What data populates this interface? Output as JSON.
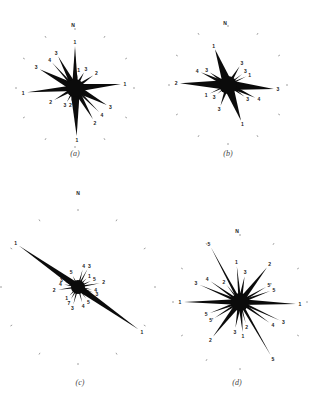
{
  "figure": {
    "panels": [
      {
        "id": "a",
        "caption": "(a)",
        "center": [
          75,
          88
        ],
        "north_label": "N",
        "north_pos": [
          73,
          27
        ],
        "ring_radius": 58,
        "spikes": [
          {
            "angle": 0,
            "length": 42,
            "width": 6,
            "label": "1"
          },
          {
            "angle": -28,
            "length": 36,
            "width": 6,
            "label": "3"
          },
          {
            "angle": -42,
            "length": 34,
            "width": 3,
            "label": "4"
          },
          {
            "angle": -62,
            "length": 40,
            "width": 8,
            "label": "3"
          },
          {
            "angle": -95,
            "length": 48,
            "width": 6,
            "label": "1"
          },
          {
            "angle": -120,
            "length": 24,
            "width": 4,
            "label": "2"
          },
          {
            "angle": -150,
            "length": 16,
            "width": 3,
            "label": "3"
          },
          {
            "angle": -165,
            "length": 14,
            "width": 3,
            "label": "2"
          },
          {
            "angle": 178,
            "length": 48,
            "width": 10,
            "label": "1"
          },
          {
            "angle": 150,
            "length": 36,
            "width": 6,
            "label": "2"
          },
          {
            "angle": 135,
            "length": 34,
            "width": 3,
            "label": "4"
          },
          {
            "angle": 118,
            "length": 36,
            "width": 8,
            "label": "3"
          },
          {
            "angle": 85,
            "length": 46,
            "width": 8,
            "label": "1"
          },
          {
            "angle": 55,
            "length": 22,
            "width": 4,
            "label": "2"
          },
          {
            "angle": 30,
            "length": 18,
            "width": 4,
            "label": "3"
          },
          {
            "angle": 12,
            "length": 14,
            "width": 2,
            "label": "1"
          }
        ]
      },
      {
        "id": "b",
        "caption": "(b)",
        "center": [
          228,
          85
        ],
        "north_label": "N",
        "north_pos": [
          225,
          25
        ],
        "ring_radius": 58,
        "spikes": [
          {
            "angle": -20,
            "length": 38,
            "width": 10,
            "label": "1"
          },
          {
            "angle": 32,
            "length": 22,
            "width": 4,
            "label": "3"
          },
          {
            "angle": 52,
            "length": 18,
            "width": 2,
            "label": "3"
          },
          {
            "angle": 65,
            "length": 20,
            "width": 2,
            "label": "1"
          },
          {
            "angle": 95,
            "length": 46,
            "width": 10,
            "label": "3"
          },
          {
            "angle": 115,
            "length": 30,
            "width": 5,
            "label": "4"
          },
          {
            "angle": 125,
            "length": 20,
            "width": 3,
            "label": "3"
          },
          {
            "angle": 160,
            "length": 38,
            "width": 10,
            "label": "1"
          },
          {
            "angle": 200,
            "length": 22,
            "width": 4,
            "label": "3"
          },
          {
            "angle": 230,
            "length": 14,
            "width": 2,
            "label": "3"
          },
          {
            "angle": 245,
            "length": 20,
            "width": 2,
            "label": "1"
          },
          {
            "angle": 272,
            "length": 48,
            "width": 10,
            "label": "2"
          },
          {
            "angle": 295,
            "length": 30,
            "width": 5,
            "label": "4"
          },
          {
            "angle": 305,
            "length": 22,
            "width": 4,
            "label": "3"
          }
        ]
      },
      {
        "id": "c",
        "caption": "(c)",
        "center": [
          78,
          287
        ],
        "north_label": "N",
        "north_pos": [
          78,
          195
        ],
        "ring_radius": 76,
        "spikes": [
          {
            "angle": -55,
            "length": 72,
            "width": 7,
            "label": "1"
          },
          {
            "angle": 125,
            "length": 74,
            "width": 7,
            "label": "1"
          },
          {
            "angle": 15,
            "length": 18,
            "width": 2,
            "label": "4"
          },
          {
            "angle": 28,
            "length": 20,
            "width": 2,
            "label": "3"
          },
          {
            "angle": 45,
            "length": 12,
            "width": 2,
            "label": "1"
          },
          {
            "angle": 65,
            "length": 14,
            "width": 2,
            "label": "5"
          },
          {
            "angle": 80,
            "length": 22,
            "width": 2,
            "label": "2"
          },
          {
            "angle": 100,
            "length": 14,
            "width": 2,
            "label": "4"
          },
          {
            "angle": 110,
            "length": 16,
            "width": 2,
            "label": "3"
          },
          {
            "angle": 145,
            "length": 14,
            "width": 2,
            "label": "5"
          },
          {
            "angle": 165,
            "length": 16,
            "width": 2,
            "label": "4"
          },
          {
            "angle": 195,
            "length": 18,
            "width": 2,
            "label": "3"
          },
          {
            "angle": 210,
            "length": 14,
            "width": 2,
            "label": "7"
          },
          {
            "angle": 225,
            "length": 12,
            "width": 2,
            "label": "1"
          },
          {
            "angle": 262,
            "length": 20,
            "width": 2,
            "label": "2"
          },
          {
            "angle": 280,
            "length": 14,
            "width": 2,
            "label": "4"
          },
          {
            "angle": 292,
            "length": 14,
            "width": 2,
            "label": "3"
          },
          {
            "angle": 335,
            "length": 12,
            "width": 2,
            "label": "5"
          }
        ]
      },
      {
        "id": "d",
        "caption": "(d)",
        "center": [
          240,
          302
        ],
        "north_label": "N",
        "north_pos": [
          237,
          233
        ],
        "ring_radius": 66,
        "spikes": [
          {
            "angle": -28,
            "length": 62,
            "width": 3,
            "label": "5"
          },
          {
            "angle": -5,
            "length": 36,
            "width": 3,
            "label": "1"
          },
          {
            "angle": 10,
            "length": 26,
            "width": 4,
            "label": "3"
          },
          {
            "angle": 38,
            "length": 44,
            "width": 6,
            "label": "2"
          },
          {
            "angle": 60,
            "length": 30,
            "width": 3,
            "label": "5'"
          },
          {
            "angle": 70,
            "length": 32,
            "width": 3,
            "label": "5"
          },
          {
            "angle": 92,
            "length": 56,
            "width": 6,
            "label": "1"
          },
          {
            "angle": 115,
            "length": 44,
            "width": 3,
            "label": "3"
          },
          {
            "angle": 125,
            "length": 36,
            "width": 3,
            "label": "4"
          },
          {
            "angle": 150,
            "length": 62,
            "width": 3,
            "label": "5"
          },
          {
            "angle": 165,
            "length": 22,
            "width": 2,
            "label": "2"
          },
          {
            "angle": 175,
            "length": 30,
            "width": 4,
            "label": "1"
          },
          {
            "angle": 190,
            "length": 26,
            "width": 4,
            "label": "3"
          },
          {
            "angle": 218,
            "length": 44,
            "width": 6,
            "label": "2"
          },
          {
            "angle": 238,
            "length": 30,
            "width": 3,
            "label": "5'"
          },
          {
            "angle": 250,
            "length": 32,
            "width": 3,
            "label": "5"
          },
          {
            "angle": 270,
            "length": 56,
            "width": 6,
            "label": "1"
          },
          {
            "angle": 293,
            "length": 44,
            "width": 3,
            "label": "3"
          },
          {
            "angle": 305,
            "length": 36,
            "width": 3,
            "label": "4"
          },
          {
            "angle": 322,
            "length": 22,
            "width": 2,
            "label": "2"
          }
        ]
      }
    ]
  }
}
